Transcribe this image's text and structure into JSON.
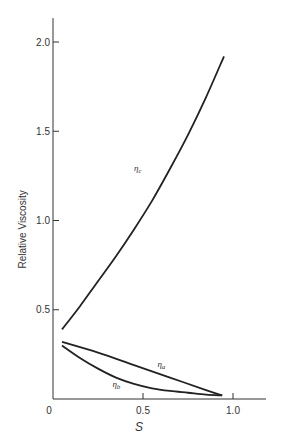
{
  "chart_data": {
    "type": "line",
    "title": "",
    "xlabel": "S",
    "ylabel": "Relative Viscosity",
    "xlim": [
      0,
      1.2
    ],
    "ylim": [
      0,
      2.1
    ],
    "x_ticks": [
      0.5,
      1.0
    ],
    "x_tick_labels": [
      "0.5",
      "1.0"
    ],
    "origin_label": "0",
    "y_ticks": [
      0.5,
      1.0,
      1.5,
      2.0
    ],
    "y_tick_labels": [
      "0.5",
      "1.0",
      "1.5",
      "2.0"
    ],
    "grid": false,
    "legend": "inline labels",
    "series": [
      {
        "name": "η_c",
        "label_main": "η",
        "label_sub": "c",
        "label_pos": [
          0.45,
          1.28
        ],
        "x": [
          0.05,
          0.15,
          0.25,
          0.35,
          0.45,
          0.55,
          0.65,
          0.75,
          0.85,
          0.95
        ],
        "values": [
          0.39,
          0.52,
          0.66,
          0.8,
          0.95,
          1.11,
          1.29,
          1.48,
          1.69,
          1.92
        ]
      },
      {
        "name": "η_a",
        "label_main": "η",
        "label_sub": "a",
        "label_pos": [
          0.58,
          0.18
        ],
        "x": [
          0.05,
          0.25,
          0.45,
          0.65,
          0.85,
          0.94
        ],
        "values": [
          0.32,
          0.26,
          0.19,
          0.12,
          0.05,
          0.02
        ]
      },
      {
        "name": "η_b",
        "label_main": "η",
        "label_sub": "b",
        "label_pos": [
          0.33,
          0.07
        ],
        "x": [
          0.05,
          0.15,
          0.25,
          0.35,
          0.45,
          0.55,
          0.65,
          0.75,
          0.85,
          0.94
        ],
        "values": [
          0.3,
          0.23,
          0.17,
          0.12,
          0.085,
          0.06,
          0.045,
          0.035,
          0.025,
          0.02
        ]
      }
    ]
  }
}
